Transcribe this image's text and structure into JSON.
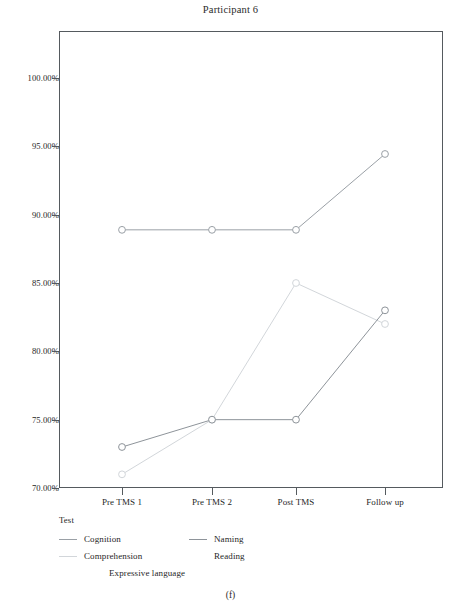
{
  "figure": {
    "caption": "(f)"
  },
  "chart_data": {
    "type": "line",
    "title": "Participant 6",
    "xlabel": "",
    "ylabel": "",
    "categories": [
      "Pre TMS 1",
      "Pre TMS 2",
      "Post TMS",
      "Follow up"
    ],
    "ylim": [
      70,
      100
    ],
    "ytick_labels": [
      "70.00%",
      "75.00%",
      "80.00%",
      "85.00%",
      "90.00%",
      "95.00%",
      "100.00%"
    ],
    "ytick_values": [
      70,
      75,
      80,
      85,
      90,
      95,
      100
    ],
    "grid": false,
    "legend_position": "below-left",
    "legend_title": "Test",
    "series": [
      {
        "name": "Cognition",
        "values": [
          88.89,
          88.89,
          88.89,
          94.44
        ],
        "color": "#9aa0a6",
        "marker": "circle",
        "has_swatch": true
      },
      {
        "name": "Comprehension",
        "values": [
          71.0,
          75.0,
          85.0,
          82.0
        ],
        "color": "#d2d6da",
        "marker": "circle",
        "has_swatch": true
      },
      {
        "name": "Expressive language",
        "values": [
          null,
          null,
          null,
          null
        ],
        "color": "#f2f3f4",
        "marker": "circle",
        "has_swatch": false
      },
      {
        "name": "Naming",
        "values": [
          73.0,
          75.0,
          75.0,
          83.0
        ],
        "color": "#8e949a",
        "marker": "circle",
        "has_swatch": true
      },
      {
        "name": "Reading",
        "values": [
          null,
          null,
          null,
          null
        ],
        "color": "#fafbfb",
        "marker": "circle",
        "has_swatch": false
      }
    ]
  }
}
